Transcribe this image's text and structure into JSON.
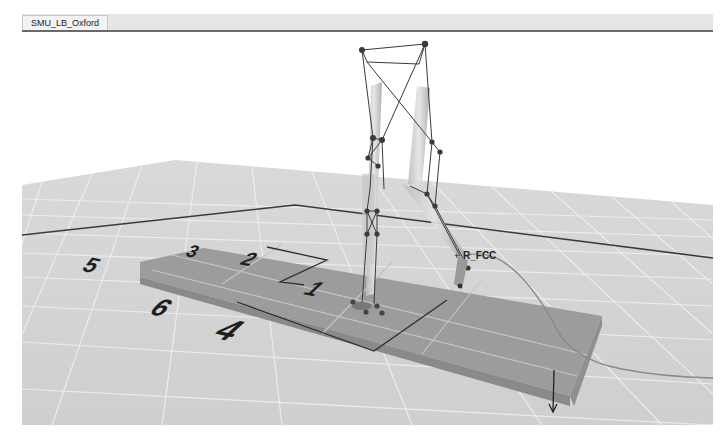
{
  "window": {
    "tab_label": "SMU_LB_Oxford"
  },
  "scene": {
    "background_color": "#ffffff",
    "floor_color": "#d4d4d4",
    "grid_line_color": "#ececec",
    "plate_color": "#9a9a9a",
    "plate_edge_color": "#8a8a8a",
    "axis_line_color": "#3a3a3a",
    "force_plates": [
      {
        "number": "3"
      },
      {
        "number": "5"
      },
      {
        "number": "2"
      },
      {
        "number": "6"
      },
      {
        "number": "1"
      },
      {
        "number": "4"
      }
    ],
    "marker_label": "R_FCC"
  }
}
